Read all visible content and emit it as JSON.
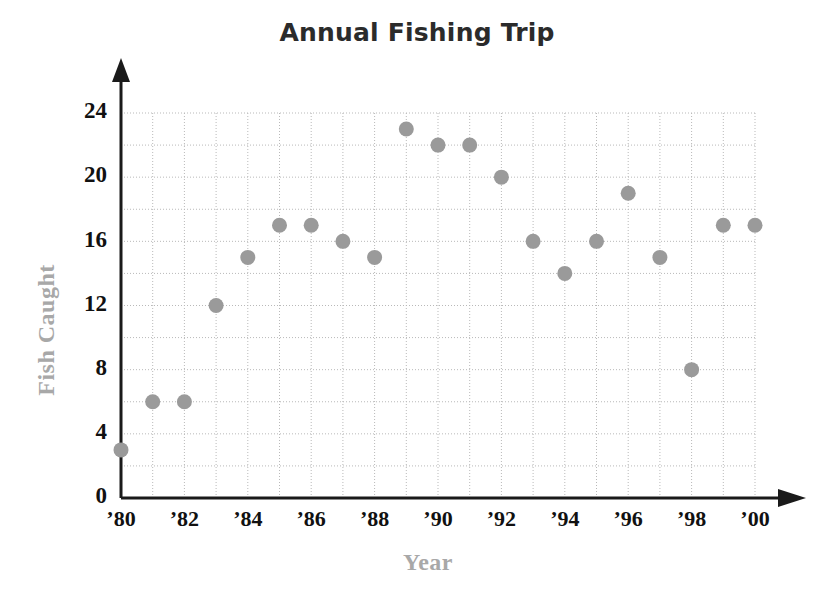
{
  "chart_data": {
    "type": "scatter",
    "title": "Annual Fishing Trip",
    "xlabel": "Year",
    "ylabel": "Fish Caught",
    "x": [
      1980,
      1981,
      1982,
      1983,
      1984,
      1985,
      1986,
      1987,
      1988,
      1989,
      1990,
      1991,
      1992,
      1993,
      1994,
      1995,
      1996,
      1997,
      1998,
      1999,
      2000
    ],
    "values": [
      3,
      6,
      6,
      12,
      15,
      17,
      17,
      16,
      15,
      23,
      22,
      22,
      20,
      16,
      14,
      16,
      19,
      15,
      8,
      17,
      17
    ],
    "x_tick_labels": [
      "’80",
      "’82",
      "’84",
      "’86",
      "’88",
      "’90",
      "’92",
      "’94",
      "’96",
      "’98",
      "’00"
    ],
    "x_tick_values": [
      1980,
      1982,
      1984,
      1986,
      1988,
      1990,
      1992,
      1994,
      1996,
      1998,
      2000
    ],
    "y_tick_labels": [
      "0",
      "4",
      "8",
      "12",
      "16",
      "20",
      "24"
    ],
    "y_tick_values": [
      0,
      4,
      8,
      12,
      16,
      20,
      24
    ],
    "xlim": [
      1980,
      2000
    ],
    "ylim": [
      0,
      24
    ],
    "grid": true,
    "grid_y_step": 2,
    "grid_x_step": 1,
    "legend": "none",
    "marker_color": "#9a9a9a",
    "axis_color": "#1a1a1a",
    "grid_color": "#b9b9b9",
    "label_color": "#a8a8a8",
    "title_color": "#2b2b2b"
  }
}
